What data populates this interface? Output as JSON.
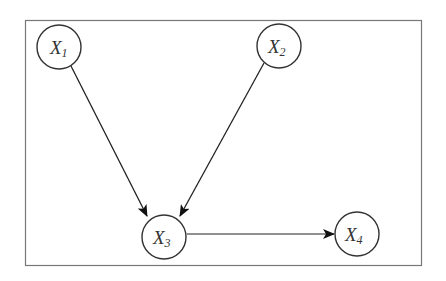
{
  "diagram": {
    "type": "directed-graph",
    "frame": {
      "x": 25,
      "y": 20,
      "width": 397,
      "height": 246,
      "stroke": "#777777"
    },
    "colors": {
      "node_stroke": "#333333",
      "edge": "#222222",
      "background": "#ffffff"
    },
    "nodes": [
      {
        "id": "X1",
        "base": "X",
        "sub": "1",
        "cx": 59,
        "cy": 47,
        "r": 22
      },
      {
        "id": "X2",
        "base": "X",
        "sub": "2",
        "cx": 279,
        "cy": 46,
        "r": 22
      },
      {
        "id": "X3",
        "base": "X",
        "sub": "3",
        "cx": 164,
        "cy": 237,
        "r": 22
      },
      {
        "id": "X4",
        "base": "X",
        "sub": "4",
        "cx": 357,
        "cy": 234,
        "r": 22
      }
    ],
    "edges": [
      {
        "from": "X1",
        "to": "X3"
      },
      {
        "from": "X2",
        "to": "X3"
      },
      {
        "from": "X3",
        "to": "X4"
      }
    ]
  }
}
